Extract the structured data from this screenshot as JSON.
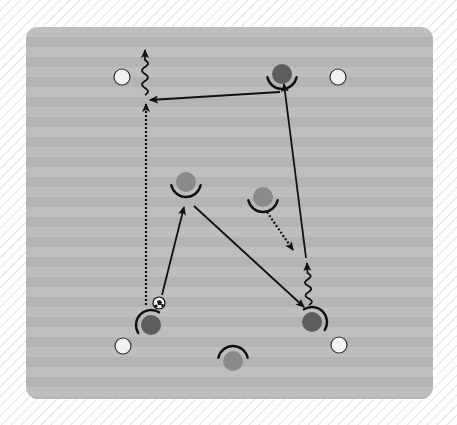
{
  "caption": "— — —",
  "colors": {
    "hatch_bg": "#ffffff",
    "hatch_line": "#e4e4e4",
    "field_light": "#bebebe",
    "field_dark": "#b4b4b4",
    "cone_fill": "#f2f2f2",
    "cone_stroke": "#333333",
    "player_gray": "#8a8a8a",
    "player_dark": "#5e5e5e",
    "line": "#111111"
  },
  "field": {
    "x": 26,
    "y": 27,
    "width": 407,
    "height": 372,
    "radius": 12,
    "stripe_height": 10
  },
  "cones": [
    {
      "id": "cone-top-left",
      "x": 122,
      "y": 77
    },
    {
      "id": "cone-top-right",
      "x": 338,
      "y": 77
    },
    {
      "id": "cone-bottom-left",
      "x": 123,
      "y": 346
    },
    {
      "id": "cone-bottom-right",
      "x": 339,
      "y": 345
    }
  ],
  "players": [
    {
      "id": "player-top",
      "x": 282,
      "y": 74,
      "facing": "down",
      "tone": "dark"
    },
    {
      "id": "player-mid-left",
      "x": 186,
      "y": 182,
      "facing": "down",
      "tone": "gray"
    },
    {
      "id": "player-mid-right",
      "x": 263,
      "y": 197,
      "facing": "down",
      "tone": "gray"
    },
    {
      "id": "player-bottom-left",
      "x": 151,
      "y": 325,
      "facing": "up-left",
      "tone": "dark"
    },
    {
      "id": "player-bottom-right",
      "x": 312,
      "y": 322,
      "facing": "up-right",
      "tone": "dark"
    },
    {
      "id": "player-bottom-center",
      "x": 233,
      "y": 361,
      "facing": "up",
      "tone": "gray"
    }
  ],
  "ball": {
    "x": 159,
    "y": 303,
    "r": 6
  },
  "arrows": [
    {
      "id": "pass-top-to-left",
      "type": "solid",
      "points": [
        [
          280,
          92
        ],
        [
          150,
          100
        ]
      ]
    },
    {
      "id": "run-bottom-left-up",
      "type": "dotted",
      "points": [
        [
          146,
          305
        ],
        [
          146,
          104
        ]
      ]
    },
    {
      "id": "dribble-top-left",
      "type": "wavy",
      "points": [
        [
          145,
          95
        ],
        [
          145,
          50
        ]
      ]
    },
    {
      "id": "pass-ball-to-mid-left",
      "type": "solid",
      "points": [
        [
          162,
          295
        ],
        [
          184,
          207
        ]
      ]
    },
    {
      "id": "pass-mid-left-to-bottom-right",
      "type": "solid",
      "points": [
        [
          194,
          206
        ],
        [
          304,
          307
        ]
      ]
    },
    {
      "id": "run-mid-right-dotted",
      "type": "dotted",
      "points": [
        [
          267,
          212
        ],
        [
          293,
          250
        ]
      ]
    },
    {
      "id": "dribble-bottom-right-up",
      "type": "wavy",
      "points": [
        [
          309,
          305
        ],
        [
          307,
          263
        ]
      ]
    },
    {
      "id": "pass-to-top-player",
      "type": "solid",
      "points": [
        [
          306,
          258
        ],
        [
          284,
          84
        ]
      ]
    }
  ]
}
